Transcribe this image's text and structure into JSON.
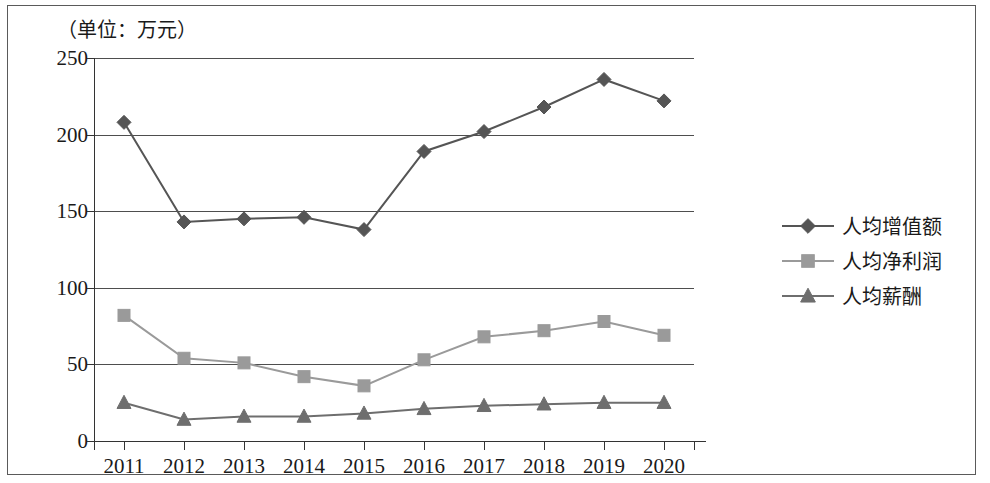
{
  "chart_data": {
    "type": "line",
    "title": "（单位：万元）",
    "xlabel": "",
    "ylabel": "",
    "unit_note": "（单位：万元）",
    "categories": [
      "2011",
      "2012",
      "2013",
      "2014",
      "2015",
      "2016",
      "2017",
      "2018",
      "2019",
      "2020"
    ],
    "ylim": [
      0,
      250
    ],
    "yticks": [
      0,
      50,
      100,
      150,
      200,
      250
    ],
    "grid": true,
    "legend_position": "right",
    "series": [
      {
        "name": "人均增值额",
        "marker": "diamond",
        "color": "#555555",
        "values": [
          208,
          143,
          145,
          146,
          138,
          189,
          202,
          218,
          236,
          222
        ]
      },
      {
        "name": "人均净利润",
        "marker": "square",
        "color": "#9a9a9a",
        "values": [
          82,
          54,
          51,
          42,
          36,
          53,
          68,
          72,
          78,
          69
        ]
      },
      {
        "name": "人均薪酬",
        "marker": "triangle",
        "color": "#6e6e6e",
        "values": [
          25,
          14,
          16,
          16,
          18,
          21,
          23,
          24,
          25,
          25
        ]
      }
    ]
  },
  "legend": {
    "items": [
      {
        "label": "人均增值额",
        "marker": "diamond",
        "color": "#555555"
      },
      {
        "label": "人均净利润",
        "marker": "square",
        "color": "#9a9a9a"
      },
      {
        "label": "人均薪酬",
        "marker": "triangle",
        "color": "#6e6e6e"
      }
    ]
  },
  "axis": {
    "y_tick_labels": [
      "250",
      "200",
      "150",
      "100",
      "50",
      "0"
    ],
    "x_tick_labels": [
      "2011",
      "2012",
      "2013",
      "2014",
      "2015",
      "2016",
      "2017",
      "2018",
      "2019",
      "2020"
    ]
  }
}
